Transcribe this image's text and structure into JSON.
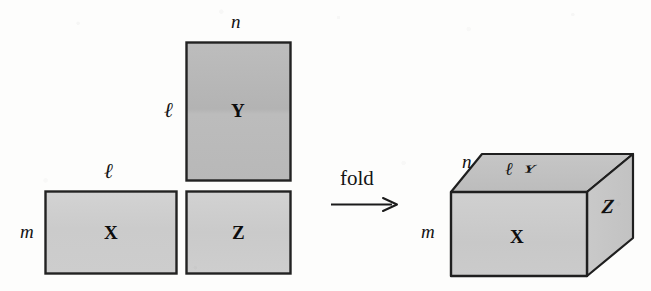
{
  "figure": {
    "background_color": "#fdfdfc",
    "ink_color": "#1a1a1a"
  },
  "net": {
    "caption": "unfolded net",
    "faces": [
      {
        "id": "X",
        "label": "X",
        "fill": "#cfcfcf",
        "x": 45,
        "y": 191,
        "w": 131,
        "h": 82
      },
      {
        "id": "Y",
        "label": "Y",
        "fill": "#b6b6b6",
        "x": 186,
        "y": 42,
        "w": 104,
        "h": 138
      },
      {
        "id": "Z",
        "label": "Z",
        "fill": "#cfcfcf",
        "x": 186,
        "y": 191,
        "w": 104,
        "h": 82
      }
    ],
    "dimension_labels": [
      {
        "name": "m",
        "text": "m",
        "x": 20,
        "y": 222
      },
      {
        "name": "ell-top-x",
        "text": "ℓ",
        "x": 104,
        "y": 161
      },
      {
        "name": "n",
        "text": "n",
        "x": 231,
        "y": 12
      },
      {
        "name": "ell-left-y",
        "text": "ℓ",
        "x": 164,
        "y": 100
      }
    ]
  },
  "fold": {
    "label": "fold",
    "label_x": 340,
    "label_y": 168,
    "arrow": {
      "x1": 331,
      "y1": 204,
      "x2": 397,
      "y2": 204
    }
  },
  "box": {
    "caption": "folded box",
    "front_face": {
      "label": "X",
      "fill": "#cbcbcb",
      "points": "451,192 587,192 587,276 451,276"
    },
    "top_face": {
      "label": "ℓ",
      "secondary_label": "Y",
      "fill": "#c0c0c0",
      "points": "451,192 482,154 633,154 587,192"
    },
    "right_face": {
      "label": "Z",
      "fill": "#c6c6c6",
      "points": "587,192 633,154 633,238 587,276"
    },
    "dimension_labels": [
      {
        "name": "m",
        "text": "m",
        "x": 421,
        "y": 222
      },
      {
        "name": "n",
        "text": "n",
        "x": 462,
        "y": 152
      }
    ]
  }
}
